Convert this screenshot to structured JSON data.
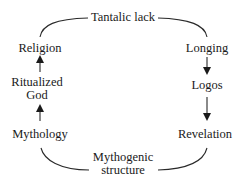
{
  "diagram": {
    "type": "cycle",
    "nodes": {
      "top": "Tantalic lack",
      "left_top": "Religion",
      "right_top": "Longing",
      "left_mid_line1": "Ritualized",
      "left_mid_line2": "God",
      "right_mid": "Logos",
      "left_bottom": "Mythology",
      "right_bottom": "Revelation",
      "bottom_line1": "Mythogenic",
      "bottom_line2": "structure"
    },
    "edges": [
      {
        "from": "Tantalic lack",
        "to": "Longing",
        "style": "curve"
      },
      {
        "from": "Longing",
        "to": "Logos",
        "style": "arrow"
      },
      {
        "from": "Logos",
        "to": "Revelation",
        "style": "arrow"
      },
      {
        "from": "Revelation",
        "to": "Mythogenic structure",
        "style": "curve"
      },
      {
        "from": "Mythogenic structure",
        "to": "Mythology",
        "style": "curve"
      },
      {
        "from": "Mythology",
        "to": "Ritualized God",
        "style": "arrow"
      },
      {
        "from": "Ritualized God",
        "to": "Religion",
        "style": "arrow"
      },
      {
        "from": "Religion",
        "to": "Tantalic lack",
        "style": "curve"
      }
    ],
    "colors": {
      "line": "#2a2a2a",
      "text": "#1a1a1a",
      "background": "#ffffff"
    }
  }
}
